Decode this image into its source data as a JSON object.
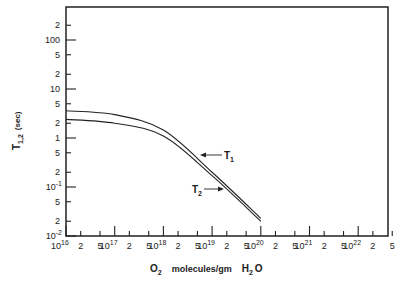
{
  "chart_data": {
    "type": "line",
    "title": "",
    "xlabel": "O2 molecules/gm H2O",
    "ylabel": "T1,2 (sec)",
    "xscale": "log",
    "yscale": "log",
    "xlim": [
      1e+16,
      5e+22
    ],
    "ylim": [
      0.01,
      300
    ],
    "grid": false,
    "x_major_ticks": [
      "10^16",
      "10^17",
      "10^18",
      "10^19",
      "10^20",
      "10^21",
      "10^22"
    ],
    "x_tick_labels": [
      "10^16",
      "2",
      "5",
      "10^17",
      "2",
      "5",
      "10^18",
      "2",
      "5",
      "10^19",
      "2",
      "5",
      "10^20",
      "2",
      "5",
      "10^21",
      "2",
      "5",
      "10^22",
      "2",
      "5"
    ],
    "y_tick_labels": [
      "10^-2",
      "2",
      "5",
      "10^-1",
      "2",
      "5",
      "1",
      "2",
      "5",
      "10",
      "2",
      "5",
      "100",
      "2"
    ],
    "x": [
      1e+16,
      1e+17,
      1e+18,
      1e+19,
      1e+20
    ],
    "series": [
      {
        "name": "T1",
        "values": [
          3.6,
          3.0,
          1.45,
          0.2,
          0.023
        ]
      },
      {
        "name": "T2",
        "values": [
          2.4,
          2.0,
          1.1,
          0.17,
          0.02
        ]
      }
    ],
    "annotations": [
      {
        "text": "T1",
        "arrow_to": "upper curve",
        "position": "right of curve near 2e19"
      },
      {
        "text": "T2",
        "arrow_to": "lower curve",
        "position": "left of curve near 1e19"
      }
    ]
  },
  "labels": {
    "y_title_main": "T",
    "y_title_sub": "1,2",
    "y_title_unit": "(sec)",
    "x_title_a": "O",
    "x_title_a_sub": "2",
    "x_title_b": "molecules/gm",
    "x_title_c": "H",
    "x_title_c_sub": "2",
    "x_title_d": "O",
    "t1_label": "T",
    "t1_sub": "1",
    "t2_label": "T",
    "t2_sub": "2"
  },
  "x_ticks": [
    {
      "label": "10",
      "sup": "16",
      "major": true
    },
    {
      "label": "2"
    },
    {
      "label": "5"
    },
    {
      "label": "10",
      "sup": "17",
      "major": true
    },
    {
      "label": "2"
    },
    {
      "label": "5"
    },
    {
      "label": "10",
      "sup": "18",
      "major": true
    },
    {
      "label": "2"
    },
    {
      "label": "5"
    },
    {
      "label": "10",
      "sup": "19",
      "major": true
    },
    {
      "label": "2"
    },
    {
      "label": "5"
    },
    {
      "label": "10",
      "sup": "20",
      "major": true
    },
    {
      "label": "2"
    },
    {
      "label": "5"
    },
    {
      "label": "10",
      "sup": "21",
      "major": true
    },
    {
      "label": "2"
    },
    {
      "label": "5"
    },
    {
      "label": "10",
      "sup": "22",
      "major": true
    },
    {
      "label": "2"
    },
    {
      "label": "5"
    }
  ],
  "y_ticks": [
    {
      "label": "10",
      "sup": "-2",
      "major": true
    },
    {
      "label": "2"
    },
    {
      "label": "5"
    },
    {
      "label": "10",
      "sup": "-1",
      "major": true
    },
    {
      "label": "2"
    },
    {
      "label": "5"
    },
    {
      "label": "1",
      "major": true
    },
    {
      "label": "2"
    },
    {
      "label": "5"
    },
    {
      "label": "10",
      "major": true
    },
    {
      "label": "2"
    },
    {
      "label": "5"
    },
    {
      "label": "100",
      "major": true
    },
    {
      "label": "2"
    }
  ]
}
